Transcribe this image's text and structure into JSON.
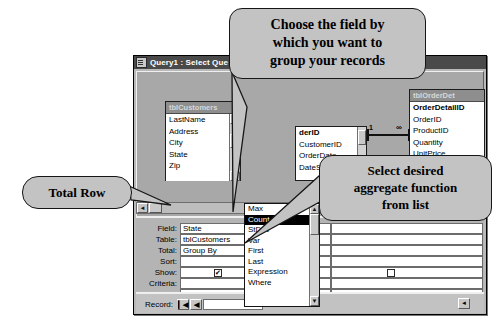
{
  "window": {
    "title": "Query1 : Select Que",
    "icon": "query-window-icon"
  },
  "diagram": {
    "tables": [
      {
        "name": "tblCustomers",
        "fields": [
          "LastName",
          "Address",
          "City",
          "State",
          "Zip"
        ],
        "has_scrollbar": true,
        "scroll_up": "▲",
        "scroll_down": "▼"
      },
      {
        "name": "tblOrders",
        "fields": [
          "derID",
          "CustomerID",
          "OrderDate",
          "DateShipped"
        ],
        "pk_field": "derID",
        "has_scrollbar": true,
        "scroll_down": "▼"
      },
      {
        "name": "tblOrderDet",
        "fields": [
          "OrderDetailID",
          "OrderID",
          "ProductID",
          "Quantity",
          "UnitPrice"
        ],
        "pk_field": "OrderDetailID",
        "has_scrollbar": false
      }
    ],
    "join": {
      "one_label": "1",
      "many_label": "∞"
    },
    "hscroll": {
      "left_arrow": "◄"
    }
  },
  "grid": {
    "row_labels": [
      "Field:",
      "Table:",
      "Total:",
      "Sort:",
      "Show:",
      "Criteria:",
      "or:"
    ],
    "columns": [
      {
        "field": "State",
        "table": "tblCustomers",
        "total": "Group By",
        "sort": "",
        "show": true,
        "criteria": "",
        "or": ""
      },
      {
        "field": "OrderID",
        "table": "tblOrders",
        "total": "Count",
        "total_has_caret": true,
        "sort": "",
        "show": true,
        "criteria": "",
        "or": ""
      },
      {
        "field": "",
        "table": "",
        "total": "",
        "sort": "",
        "show": false,
        "criteria": "",
        "or": ""
      }
    ],
    "checkbox_glyph": "✔",
    "hscroll_left_arrow": "◄"
  },
  "dropdown": {
    "selected": "Count",
    "options": [
      "Max",
      "Count",
      "StDev",
      "Var",
      "First",
      "Last",
      "Expression",
      "Where"
    ],
    "scroll_up": "▲",
    "scroll_down": "▼"
  },
  "record_nav": {
    "label": "Record:",
    "first_button": "▎◀",
    "prev_button": "◀",
    "value": "1",
    "right_arrow": "◄"
  },
  "callouts": [
    {
      "id": "group-field-callout",
      "lines": [
        "Choose the field by",
        "which you want to",
        "group your records"
      ]
    },
    {
      "id": "aggregate-callout",
      "lines": [
        "Select desired",
        "aggregate function",
        "from list"
      ]
    },
    {
      "id": "total-row-callout",
      "lines": [
        "Total Row"
      ]
    }
  ],
  "colors": {
    "callout_fill": "#c3c3c3",
    "titlebar": "#4a4a4a",
    "window_face": "#b9b9b9",
    "selection": "#000000"
  }
}
